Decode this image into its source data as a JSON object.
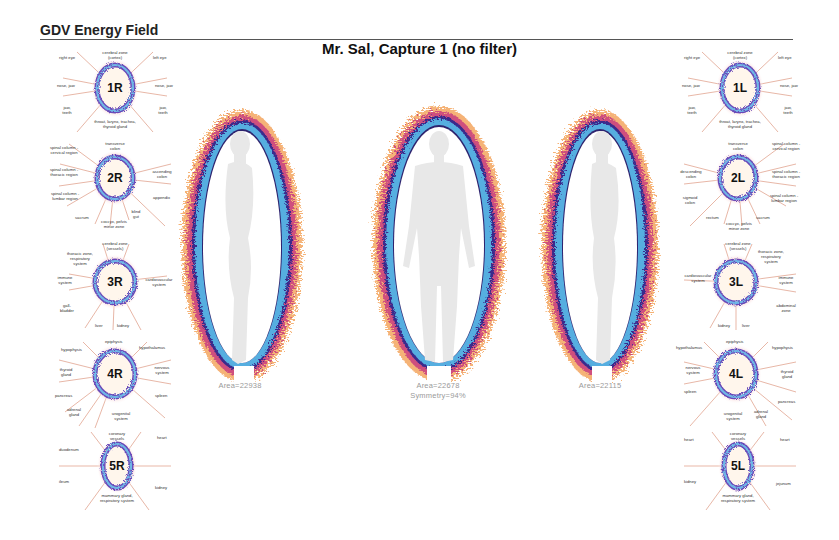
{
  "header": {
    "title": "GDV Energy Field",
    "subtitle": "Mr. Sal, Capture 1 (no filter)"
  },
  "colors": {
    "aura_outer": "#f2a25a",
    "aura_mid": "#c84a7a",
    "aura_dark": "#3b2a8a",
    "aura_inner": "#4aa6dc",
    "body_silhouette": "#ececec",
    "ray": "#c8553a"
  },
  "figures": [
    {
      "view": "right-side",
      "area_label": "Area=22938"
    },
    {
      "view": "front",
      "area_label": "Area=22678",
      "symmetry_label": "Symmetry=94%"
    },
    {
      "view": "left-side",
      "area_label": "Area=22115"
    }
  ],
  "sectors_right": [
    {
      "code": "1R",
      "labels": {
        "top": "cerebral zone (cortex)",
        "tl": "right eye",
        "tr": "left eye",
        "ml": "nose, jaw",
        "mr": "nose, jaw",
        "bl": "jaw, teeth",
        "br": "jaw, teeth",
        "bottom": "throat, larynx, trachea, thyroid gland"
      }
    },
    {
      "code": "2R",
      "labels": {
        "top": "transverse colon",
        "tl": "spinal column - cervical region",
        "ml": "spinal column - thoracic region",
        "mr": "ascending colon",
        "bl": "spinal column - lumbar region",
        "br": "appendix",
        "b1": "sacrum",
        "b2": "coccyx, pelvis minor zone",
        "b3": "blind gut"
      }
    },
    {
      "code": "3R",
      "labels": {
        "top": "cerebral zone (vessels)",
        "tl": "thoracic zone, respiratory system",
        "ml": "immune system",
        "mr": "cardiovascular system",
        "bl": "gall-bladder",
        "b1": "liver",
        "b2": "kidney"
      }
    },
    {
      "code": "4R",
      "labels": {
        "top": "epiphysis",
        "tl": "hypophysis",
        "tr": "hypothalamus",
        "ml": "thyroid gland",
        "mr": "nervous system",
        "bl": "pancreas",
        "br": "spleen",
        "b1": "adrenal gland",
        "b2": "urogenital system"
      }
    },
    {
      "code": "5R",
      "labels": {
        "top": "coronary vessels",
        "tl": "duodenum",
        "tr": "heart",
        "bl": "ileum",
        "br": "kidney",
        "bottom": "mammary gland, respiratory system"
      }
    }
  ],
  "sectors_left": [
    {
      "code": "1L",
      "labels": {
        "top": "cerebral zone (cortex)",
        "tl": "right eye",
        "tr": "left eye",
        "ml": "nose, jaw",
        "mr": "nose, jaw",
        "bl": "jaw, teeth",
        "br": "jaw, teeth",
        "bottom": "throat, larynx, trachea, thyroid gland"
      }
    },
    {
      "code": "2L",
      "labels": {
        "top": "transverse colon",
        "tr": "spinal column - cervical region",
        "ml": "descending colon",
        "mr": "spinal column - thoracic region",
        "bl": "sigmoid colon",
        "br": "spinal column - lumbar region",
        "b1": "rectum",
        "b2": "coccyx, pelvis minor zone",
        "b3": "sacrum"
      }
    },
    {
      "code": "3L",
      "labels": {
        "top": "cerebral zone (vessels)",
        "tr": "thoracic zone, respiratory system",
        "ml": "cardiovascular system",
        "mr": "immune system",
        "br": "abdominal zone",
        "b1": "kidney",
        "b2": "liver"
      }
    },
    {
      "code": "4L",
      "labels": {
        "top": "epiphysis",
        "tl": "hypothalamus",
        "tr": "hypophysis",
        "ml": "nervous system",
        "mr": "thyroid gland",
        "bl": "spleen",
        "br": "pancreas",
        "b1": "urogenital system",
        "b2": "adrenal gland"
      }
    },
    {
      "code": "5L",
      "labels": {
        "top": "coronary vessels",
        "tl": "heart",
        "tr": "heart",
        "bl": "kidney",
        "br": "jejunum",
        "bottom": "mammary gland, respiratory system"
      }
    }
  ]
}
